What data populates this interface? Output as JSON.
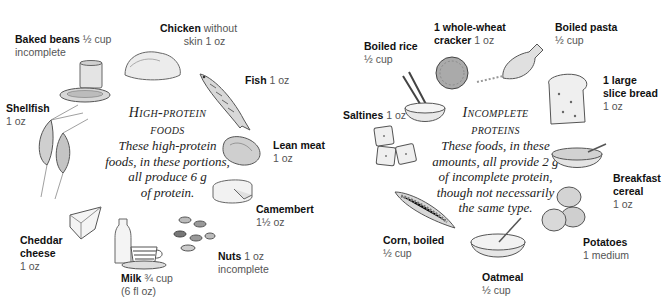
{
  "left_panel": {
    "title_line1": "High-protein",
    "title_line2": "foods",
    "description": [
      "These high-protein",
      "foods, in these portions,",
      "all produce 6 g",
      "of protein."
    ],
    "items": [
      {
        "name": "Baked beans",
        "amount": "½ cup",
        "note": "incomplete"
      },
      {
        "name": "Chicken",
        "amount": "without",
        "amount2": "skin 1 oz"
      },
      {
        "name": "Fish",
        "amount": "1 oz"
      },
      {
        "name": "Lean meat",
        "amount": "1 oz"
      },
      {
        "name": "Camembert",
        "amount": "1½ oz"
      },
      {
        "name": "Nuts",
        "amount": "1 oz",
        "note": "incomplete"
      },
      {
        "name": "Milk",
        "amount": "¾ cup",
        "note": "(6 fl oz)"
      },
      {
        "name": "Cheddar",
        "name2": "cheese",
        "amount": "1 oz"
      },
      {
        "name": "Shellfish",
        "amount": "1 oz"
      }
    ]
  },
  "right_panel": {
    "title_line1": "Incomplete",
    "title_line2": "proteins",
    "description": [
      "These foods, in these",
      "amounts, all provide 2 g",
      "of incomplete protein,",
      "though not necessarily",
      "the same type."
    ],
    "items": [
      {
        "name": "Boiled rice",
        "amount": "½ cup"
      },
      {
        "name": "1 whole-wheat",
        "name2": "cracker",
        "amount": "1 oz"
      },
      {
        "name": "Boiled pasta",
        "amount": "½ cup"
      },
      {
        "name": "1 large",
        "name2": "slice bread",
        "amount": "1 oz"
      },
      {
        "name": "Breakfast",
        "name2": "cereal",
        "amount": "1 oz"
      },
      {
        "name": "Potatoes",
        "amount": "1 medium"
      },
      {
        "name": "Oatmeal",
        "amount": "½ cup"
      },
      {
        "name": "Corn, boiled",
        "amount": "½ cup"
      },
      {
        "name": "Saltines",
        "amount": "1 oz"
      }
    ]
  },
  "colors": {
    "ink": "#2a2a2a",
    "sketch": "#6b6b6b",
    "fill": "#e6e6e6",
    "background": "#ffffff"
  }
}
